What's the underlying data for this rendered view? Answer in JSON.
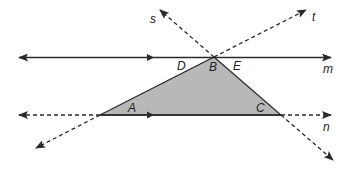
{
  "diagram": {
    "type": "geometry-parallel-lines-triangle",
    "colors": {
      "stroke": "#2a2a2a",
      "triangle_fill": "#b8b8b8",
      "background": "#ffffff"
    },
    "lines": {
      "m": {
        "label": "m",
        "style": "solid",
        "parallel_to": "n"
      },
      "n": {
        "label": "n",
        "style": "solid-between-A-C-dashed-outside",
        "parallel_to": "m"
      },
      "s": {
        "label": "s",
        "style": "dashed",
        "through": [
          "C",
          "B"
        ]
      },
      "t": {
        "label": "t",
        "style": "dashed",
        "through": [
          "A",
          "B"
        ]
      }
    },
    "points": {
      "A": {
        "label": "A",
        "type": "vertex-angle"
      },
      "B": {
        "label": "B",
        "type": "vertex-angle"
      },
      "C": {
        "label": "C",
        "type": "vertex-angle"
      },
      "D": {
        "label": "D",
        "type": "angle"
      },
      "E": {
        "label": "E",
        "type": "angle"
      }
    },
    "triangle": {
      "vertices": [
        "A",
        "B",
        "C"
      ],
      "shaded": true
    }
  }
}
